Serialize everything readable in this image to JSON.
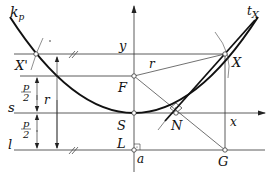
{
  "diagram": {
    "type": "parabola-construction",
    "labels": {
      "curve": "k",
      "curve_sub": "p",
      "tangent": "t",
      "tangent_sub": "X",
      "point_x_prime": "X'",
      "point_x": "X",
      "axis_y": "y",
      "axis_x": "x",
      "radius_top": "r",
      "radius_left": "r",
      "focus": "F",
      "vertex": "S",
      "foot_l": "L",
      "normal_point": "N",
      "point_g": "G",
      "line_s": "s",
      "line_l": "l",
      "line_a": "a",
      "half_p_num": "p",
      "half_p_den": "2",
      "half_p_num2": "p",
      "half_p_den2": "2"
    },
    "colors": {
      "stroke": "#222222",
      "curve": "#111111",
      "background": "#ffffff"
    }
  }
}
